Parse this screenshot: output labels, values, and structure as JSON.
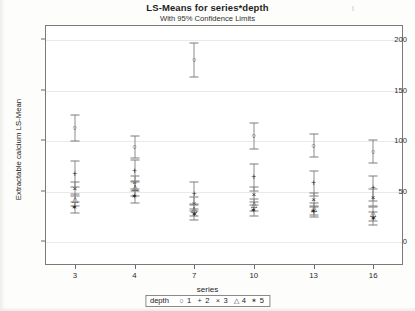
{
  "chart_data": {
    "type": "scatter",
    "title": "LS-Means for series*depth",
    "subtitle": "With 95% Confidence Limits",
    "xlabel": "series",
    "ylabel": "Extractable calcium LS-Mean",
    "ylim": [
      0,
      210
    ],
    "yticks": [
      0,
      50,
      100,
      150,
      200
    ],
    "ytick_labels": [
      "0",
      "50",
      "100",
      "150",
      "200"
    ],
    "categories": [
      "3",
      "4",
      "7",
      "10",
      "13",
      "16"
    ],
    "grid": true,
    "legend_position": "bottom",
    "legend_title": "depth",
    "legend_entries": [
      {
        "label": "1",
        "symbol": "○"
      },
      {
        "label": "2",
        "symbol": "+"
      },
      {
        "label": "3",
        "symbol": "×"
      },
      {
        "label": "4",
        "symbol": "△"
      },
      {
        "label": "5",
        "symbol": "✶"
      }
    ],
    "series": [
      {
        "name": "1",
        "symbol": "○",
        "values": [
          112,
          93,
          179,
          104,
          94,
          88
        ],
        "ci_lower": [
          99,
          82,
          162,
          91,
          83,
          77
        ],
        "ci_upper": [
          125,
          104,
          196,
          117,
          106,
          100
        ]
      },
      {
        "name": "2",
        "symbol": "+",
        "values": [
          66,
          69,
          47,
          63,
          57,
          52
        ],
        "ci_lower": [
          53,
          58,
          36,
          50,
          45,
          40
        ],
        "ci_upper": [
          79,
          80,
          58,
          76,
          69,
          64
        ]
      },
      {
        "name": "3",
        "symbol": "×",
        "values": [
          51,
          57,
          37,
          46,
          41,
          43
        ],
        "ci_lower": [
          45,
          50,
          30,
          39,
          34,
          35
        ],
        "ci_upper": [
          58,
          64,
          44,
          53,
          48,
          51
        ]
      },
      {
        "name": "4",
        "symbol": "△",
        "values": [
          41,
          52,
          31,
          36,
          32,
          27
        ],
        "ci_lower": [
          35,
          45,
          25,
          30,
          26,
          20
        ],
        "ci_upper": [
          47,
          59,
          37,
          42,
          38,
          34
        ]
      },
      {
        "name": "5",
        "symbol": "✶",
        "values": [
          33,
          44,
          26,
          30,
          29,
          22
        ],
        "ci_lower": [
          28,
          38,
          21,
          25,
          24,
          16
        ],
        "ci_upper": [
          39,
          51,
          32,
          36,
          35,
          29
        ]
      }
    ]
  }
}
